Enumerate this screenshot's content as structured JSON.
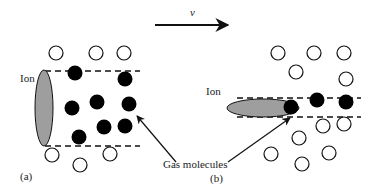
{
  "velocity": {
    "label": "v",
    "arrow": {
      "x1": 155,
      "y1": 25,
      "x2": 228,
      "y2": 25
    }
  },
  "labels": {
    "ion_a": "Ion",
    "ion_b": "Ion",
    "gas_molecules": "Gas molecules",
    "panel_a": "(a)",
    "panel_b": "(b)"
  },
  "colors": {
    "ion_fill": "#9e9e9e",
    "stroke": "#111111",
    "molecule_filled": "#000000",
    "molecule_hollow": "#ffffff"
  },
  "panel_a": {
    "ion": {
      "cx": 44,
      "cy": 108,
      "rx": 9,
      "ry": 38
    },
    "tube": {
      "x1": 45,
      "x2": 140,
      "y_top": 71,
      "y_bottom": 146
    },
    "filled_molecules": [
      [
        75,
        73
      ],
      [
        125,
        79
      ],
      [
        72,
        108
      ],
      [
        97,
        102
      ],
      [
        129,
        104
      ],
      [
        104,
        127
      ],
      [
        125,
        126
      ],
      [
        79,
        137
      ]
    ],
    "hollow_molecules": [
      [
        56,
        53
      ],
      [
        96,
        53
      ],
      [
        124,
        53
      ],
      [
        52,
        155
      ],
      [
        80,
        165
      ],
      [
        110,
        154
      ]
    ]
  },
  "panel_b": {
    "ion": {
      "cx": 263,
      "cy": 108,
      "rx": 36,
      "ry": 9
    },
    "tube": {
      "x1": 237,
      "x2": 361,
      "y_top": 98,
      "y_bottom": 117
    },
    "filled_molecules": [
      [
        291,
        107
      ],
      [
        317,
        100
      ],
      [
        346,
        102
      ]
    ],
    "hollow_molecules": [
      [
        278,
        53
      ],
      [
        314,
        53
      ],
      [
        344,
        53
      ],
      [
        296,
        72
      ],
      [
        346,
        79
      ],
      [
        323,
        126
      ],
      [
        344,
        124
      ],
      [
        299,
        138
      ],
      [
        271,
        154
      ],
      [
        329,
        153
      ],
      [
        302,
        164
      ]
    ]
  },
  "pointers": [
    {
      "from": [
        176,
        162
      ],
      "to": [
        137,
        116
      ]
    },
    {
      "from": [
        228,
        162
      ],
      "to": [
        290,
        118
      ]
    }
  ]
}
